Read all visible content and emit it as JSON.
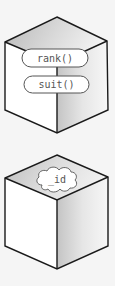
{
  "diagram": {
    "objects": [
      {
        "name": "card-object",
        "methods": [
          "rank()",
          "suit()"
        ]
      },
      {
        "name": "id-object",
        "hidden_field": "_id"
      }
    ]
  },
  "colors": {
    "background": "#f5f5f5",
    "stroke": "#1a1a1a",
    "face_light": "#ffffff",
    "face_shade": "#bdbdbd",
    "pill_fill": "#ffffff",
    "text": "#555555"
  }
}
